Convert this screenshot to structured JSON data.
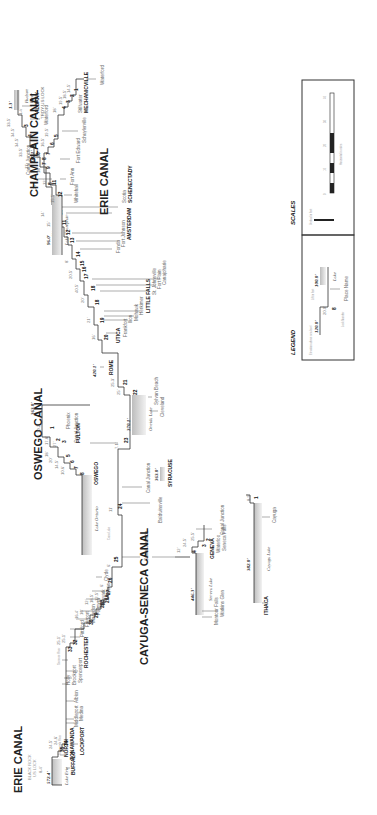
{
  "canals": {
    "erie_west": {
      "title": "ERIE CANAL",
      "note_1": "BLACK ROCK",
      "note_2": "US LOCK",
      "note_3": "8.4'",
      "start_elev": "572.4'"
    },
    "oswego": {
      "title": "OSWEGO CANAL"
    },
    "champlain": {
      "title": "CHAMPLAIN CANAL"
    },
    "erie_east": {
      "title": "ERIE CANAL"
    },
    "cayuga_seneca": {
      "title": "CAYUGA-SENECA CANAL"
    }
  },
  "lakes": {
    "erie": "Lake Erie",
    "ontario": "Lake Ontario",
    "oneida": "Oneida Lake",
    "champlain": "Lake Champlain",
    "seneca": "Seneca Lake",
    "cayuga": "Cayuga Lake",
    "hudson_1": "Hudson",
    "hudson_2": "River"
  },
  "elevations": {
    "erie": "572.4'",
    "oneida": "370.1'",
    "rome": "420.1'",
    "syracuse": "363.0'",
    "oswego_top": "363.0'",
    "champlain_summit": "140.1'",
    "champlain_lake": "96.0'",
    "seneca": "446.3'",
    "cayuga": "382.0'",
    "hudson": "1.3'"
  },
  "cities": {
    "buffalo": "BUFFALO",
    "north_1": "NORTH",
    "north_2": "TONAWANDA",
    "lockport": "LOCKPORT",
    "rochester": "ROCHESTER",
    "oswego": "OSWEGO",
    "fulton": "FULTON",
    "syracuse": "SYRACUSE",
    "rome": "ROME",
    "utica": "UTICA",
    "little_falls": "LITTLE FALLS",
    "amsterdam": "AMSTERDAM",
    "schenectady": "SCHENECTADY",
    "albany": "ALBANY",
    "mechanicville": "MECHANICVILLE",
    "geneva": "GENEVA",
    "ithaca": "ITHACA",
    "troy_lock": "TROY-US LOCK"
  },
  "places": {
    "middleport": "Middleport",
    "medina": "Medina",
    "albion": "Albion",
    "holly": "Holly",
    "brockport": "Brockport",
    "spencerport": "Spencerport",
    "pittsford": "Pittsford",
    "fairport": "Fairport",
    "macedon": "Macedon",
    "palmyra": "Palmyra",
    "newark": "Newark",
    "lyons": "Lyons",
    "clyde": "Clyde",
    "baldwinsville": "Baldwinsville",
    "canal_junction": "Canal Junction",
    "phoenix": "Phoenix",
    "sylvan_beach": "Sylvan Beach",
    "cleveland": "Cleveland",
    "frankfort": "Frankfort",
    "ilion": "Ilion",
    "mohawk": "Mohawk",
    "herkimer": "Herkimer",
    "st_johnsville": "St. Johnsville",
    "fort_plain": "Fort Plain",
    "canajoharie": "Canajoharie",
    "fonda": "Fonda",
    "fort_johnson": "Fort Johnson",
    "scotia": "Scotia",
    "waterford": "Waterford",
    "whitehall": "Whitehall",
    "fort_ann": "Fort Ann",
    "fort_edward": "Fort Edward",
    "schuylerville": "Schuylerville",
    "stillwater": "Stillwater",
    "montour_falls": "Montour Falls",
    "watkins_glen": "Watkins Glen",
    "waterloo": "Waterloo",
    "seneca_falls": "Seneca Falls",
    "cayuga": "Cayuga",
    "tonawanda_river": "Tonawanda River",
    "genesee_river": "Genesee River",
    "cross_lake": "Cross Lake"
  },
  "erie_locks": [
    "35",
    "34",
    "33",
    "32",
    "30",
    "29",
    "28B",
    "28A",
    "27",
    "26",
    "25",
    "24",
    "23",
    "22",
    "21",
    "20",
    "19",
    "18",
    "17",
    "16",
    "15",
    "14",
    "13",
    "12",
    "11",
    "10",
    "9",
    "8",
    "7",
    "6",
    "5",
    "4",
    "3",
    "2"
  ],
  "erie_lifts": [
    "24.5'",
    "24.6'",
    "25.1'",
    "25.1'",
    "16.4'",
    "16'",
    "12'",
    "18.5'",
    "12.5'",
    "6'",
    "6'",
    "11'",
    "7.1'",
    "25'",
    "25.3'",
    "16'",
    "21'",
    "20'",
    "40.5'",
    "20.5'",
    "8'",
    "8'",
    "8'",
    "11'",
    "12'",
    "15'",
    "14'",
    "27'",
    "11'",
    "33.5'",
    "34.5'",
    "34.5'",
    "33.5'",
    "1.4'"
  ],
  "oswego_locks": [
    "8",
    "7",
    "6",
    "5",
    "3",
    "2",
    "1"
  ],
  "oswego_lifts": [
    "10.6'",
    "14.5'",
    "20'",
    "18'",
    "27'",
    "17.8'",
    "10.2'"
  ],
  "champlain_locks": [
    "12",
    "11",
    "9",
    "8",
    "7",
    "6",
    "5",
    "4",
    "3",
    "2",
    "1"
  ],
  "champlain_lifts": [
    "15.5'",
    "12'",
    "18'",
    "11'",
    "10'",
    "16.5'",
    "19.5'",
    "18'",
    "19.5'",
    "18.5'",
    "14.5'"
  ],
  "cayuga_seneca_locks": [
    "4",
    "3",
    "2",
    "1"
  ],
  "cayuga_seneca_lifts": [
    "12'",
    "24.5'",
    "25.5'",
    "8.9'"
  ],
  "legend": {
    "title": "LEGEND",
    "elev_a": "120.0'",
    "elev_b": "100.0'",
    "lift": "20.0'",
    "lock_num": "8",
    "place": "Place Name",
    "lake": "Lake",
    "note_elev": "Elevation above sea level",
    "note_lock": "Lock Number",
    "note_lift": "Lift in feet"
  },
  "scales": {
    "title": "SCALES",
    "vertical": "Vertical in feet",
    "horizontal": "Horizontal in miles",
    "ticks": [
      "0",
      "10",
      "20",
      "30",
      "40"
    ]
  }
}
